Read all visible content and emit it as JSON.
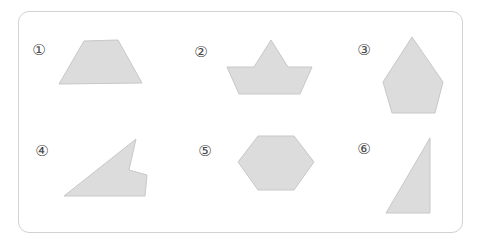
{
  "worksheet": {
    "title": "Polygon identification worksheet",
    "background_color": "#ffffff",
    "frame": {
      "border_color": "#d2d2d2",
      "corner_radius": "11px",
      "x": 18,
      "y": 11,
      "width": 445,
      "height": 222
    },
    "shape_fill_color": "#dcdcdc",
    "shape_stroke_color": "#c8c8c8",
    "marker_color": "#4a4a4a"
  },
  "figures": [
    {
      "id": "figure-1",
      "marker": "①",
      "marker_x": 30,
      "marker_y": 41,
      "name": "trapezoid",
      "sides": 4,
      "convex": true,
      "viewbox": "0 0 90 50",
      "origin_x": 56,
      "origin_y": 38,
      "width": 90,
      "height": 50,
      "points": "28,3 62,2 86,45 3,46"
    },
    {
      "id": "figure-2",
      "marker": "②",
      "marker_x": 192,
      "marker_y": 43,
      "name": "boat-concave-hexagon",
      "sides": 6,
      "convex": false,
      "viewbox": "0 0 92 62",
      "origin_x": 224,
      "origin_y": 36,
      "width": 92,
      "height": 62,
      "points": "47,4 64,31 88,31 76,58 15,58 3,31 30,31"
    },
    {
      "id": "figure-3",
      "marker": "③",
      "marker_x": 355,
      "marker_y": 41,
      "name": "kite-pentagon",
      "sides": 5,
      "convex": true,
      "viewbox": "0 0 68 82",
      "origin_x": 379,
      "origin_y": 34,
      "width": 68,
      "height": 82,
      "points": "33,3 64,48 56,79 13,79 4,48"
    },
    {
      "id": "figure-4",
      "marker": "④",
      "marker_x": 33,
      "marker_y": 142,
      "name": "concave-arrow-polygon",
      "sides": 5,
      "convex": false,
      "viewbox": "0 0 92 66",
      "origin_x": 58,
      "origin_y": 134,
      "width": 92,
      "height": 66,
      "points": "78,5 71,36 89,41 87,62 6,62"
    },
    {
      "id": "figure-5",
      "marker": "⑤",
      "marker_x": 196,
      "marker_y": 142,
      "name": "hexagon",
      "sides": 6,
      "convex": true,
      "viewbox": "0 0 84 62",
      "origin_x": 234,
      "origin_y": 132,
      "width": 84,
      "height": 62,
      "points": "24,4 60,4 80,30 60,58 24,58 4,30"
    },
    {
      "id": "figure-6",
      "marker": "⑥",
      "marker_x": 355,
      "marker_y": 140,
      "name": "right-triangle",
      "sides": 3,
      "convex": true,
      "viewbox": "0 0 56 84",
      "origin_x": 380,
      "origin_y": 133,
      "width": 56,
      "height": 84,
      "points": "50,5 50,80 6,80"
    }
  ]
}
